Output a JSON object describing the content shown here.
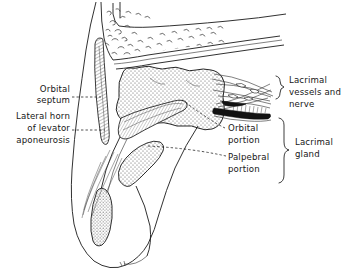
{
  "figure": {
    "background_color": "#ffffff",
    "ink_color": "#1a1a1a",
    "label_color": "#161616"
  },
  "labels": {
    "orbital_septum": {
      "lines": [
        "Orbital",
        "septum"
      ]
    },
    "lateral_horn": {
      "lines": [
        "Lateral horn",
        "of levator",
        "aponeurosis"
      ]
    },
    "lacrimal_vessels_nerve": {
      "lines": [
        "Lacrimal",
        "vessels and",
        "nerve"
      ]
    },
    "orbital_portion": {
      "lines": [
        "Orbital",
        "portion"
      ]
    },
    "palpebral_portion": {
      "lines": [
        "Palpebral",
        "portion"
      ]
    },
    "lacrimal_gland": {
      "lines": [
        "Lacrimal",
        "gland"
      ]
    }
  },
  "structures": [
    {
      "name": "orbital-bone",
      "description": "frontal bone with cancellous trabecular texture"
    },
    {
      "name": "periorbita",
      "description": "periosteal lining of orbital roof"
    },
    {
      "name": "lacrimal-gland-orbital-lobe",
      "description": "large stippled gland body"
    },
    {
      "name": "lacrimal-gland-palpebral-lobe",
      "description": "smaller stippled lobe below aponeurosis"
    },
    {
      "name": "levator-aponeurosis",
      "description": "sheet passing under the gland"
    },
    {
      "name": "orbital-septum",
      "description": "septum descending from orbital rim"
    },
    {
      "name": "lacrimal-vessels-and-nerve",
      "description": "bundle of strands entering gland posteriorly"
    },
    {
      "name": "tarsal-plate",
      "description": "stippled oval in eyelid"
    },
    {
      "name": "eyelid-skin",
      "description": "outer contour of upper eyelid"
    },
    {
      "name": "orbicularis-fibers",
      "description": "fine muscle fiber strands in lid"
    }
  ]
}
